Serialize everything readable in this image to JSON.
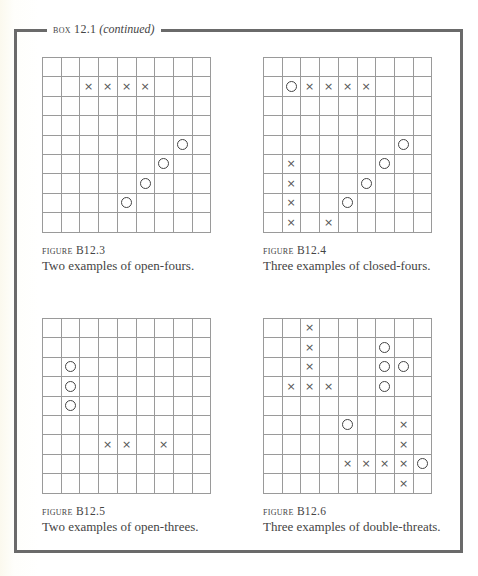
{
  "box": {
    "label_prefix": "BOX 12.1",
    "label_suffix": "(continued)"
  },
  "grid": {
    "rows": 9,
    "cols": 9
  },
  "figures": [
    {
      "id": "B12.3",
      "label_word": "FIGURE",
      "label_num": "B12.3",
      "description": "Two examples of open-fours.",
      "position": {
        "left": 42,
        "top": 57
      },
      "marks": [
        {
          "r": 1,
          "c": 2,
          "t": "x"
        },
        {
          "r": 1,
          "c": 3,
          "t": "x"
        },
        {
          "r": 1,
          "c": 4,
          "t": "x"
        },
        {
          "r": 1,
          "c": 5,
          "t": "x"
        },
        {
          "r": 4,
          "c": 7,
          "t": "o"
        },
        {
          "r": 5,
          "c": 6,
          "t": "o"
        },
        {
          "r": 6,
          "c": 5,
          "t": "o"
        },
        {
          "r": 7,
          "c": 4,
          "t": "o"
        }
      ]
    },
    {
      "id": "B12.4",
      "label_word": "FIGURE",
      "label_num": "B12.4",
      "description": "Three examples of closed-fours.",
      "position": {
        "left": 263,
        "top": 57
      },
      "marks": [
        {
          "r": 1,
          "c": 1,
          "t": "o"
        },
        {
          "r": 1,
          "c": 2,
          "t": "x"
        },
        {
          "r": 1,
          "c": 3,
          "t": "x"
        },
        {
          "r": 1,
          "c": 4,
          "t": "x"
        },
        {
          "r": 1,
          "c": 5,
          "t": "x"
        },
        {
          "r": 4,
          "c": 7,
          "t": "o"
        },
        {
          "r": 5,
          "c": 6,
          "t": "o"
        },
        {
          "r": 6,
          "c": 5,
          "t": "o"
        },
        {
          "r": 7,
          "c": 4,
          "t": "o"
        },
        {
          "r": 5,
          "c": 1,
          "t": "x"
        },
        {
          "r": 6,
          "c": 1,
          "t": "x"
        },
        {
          "r": 7,
          "c": 1,
          "t": "x"
        },
        {
          "r": 8,
          "c": 1,
          "t": "x"
        },
        {
          "r": 8,
          "c": 3,
          "t": "x"
        }
      ]
    },
    {
      "id": "B12.5",
      "label_word": "FIGURE",
      "label_num": "B12.5",
      "description": "Two examples of open-threes.",
      "position": {
        "left": 42,
        "top": 318
      },
      "marks": [
        {
          "r": 2,
          "c": 1,
          "t": "o"
        },
        {
          "r": 3,
          "c": 1,
          "t": "o"
        },
        {
          "r": 4,
          "c": 1,
          "t": "o"
        },
        {
          "r": 6,
          "c": 3,
          "t": "x"
        },
        {
          "r": 6,
          "c": 4,
          "t": "x"
        },
        {
          "r": 6,
          "c": 6,
          "t": "x"
        }
      ]
    },
    {
      "id": "B12.6",
      "label_word": "FIGURE",
      "label_num": "B12.6",
      "description": "Three examples of double-threats.",
      "position": {
        "left": 263,
        "top": 318
      },
      "marks": [
        {
          "r": 0,
          "c": 2,
          "t": "x"
        },
        {
          "r": 1,
          "c": 2,
          "t": "x"
        },
        {
          "r": 2,
          "c": 2,
          "t": "x"
        },
        {
          "r": 3,
          "c": 1,
          "t": "x"
        },
        {
          "r": 3,
          "c": 2,
          "t": "x"
        },
        {
          "r": 3,
          "c": 3,
          "t": "x"
        },
        {
          "r": 1,
          "c": 6,
          "t": "o"
        },
        {
          "r": 2,
          "c": 6,
          "t": "o"
        },
        {
          "r": 2,
          "c": 7,
          "t": "o"
        },
        {
          "r": 3,
          "c": 6,
          "t": "o"
        },
        {
          "r": 5,
          "c": 4,
          "t": "o"
        },
        {
          "r": 5,
          "c": 7,
          "t": "x"
        },
        {
          "r": 6,
          "c": 7,
          "t": "x"
        },
        {
          "r": 7,
          "c": 4,
          "t": "x"
        },
        {
          "r": 7,
          "c": 5,
          "t": "x"
        },
        {
          "r": 7,
          "c": 6,
          "t": "x"
        },
        {
          "r": 7,
          "c": 7,
          "t": "x"
        },
        {
          "r": 7,
          "c": 8,
          "t": "o"
        },
        {
          "r": 8,
          "c": 7,
          "t": "x"
        }
      ]
    }
  ],
  "mark_glyphs": {
    "x": "×",
    "o": ""
  }
}
